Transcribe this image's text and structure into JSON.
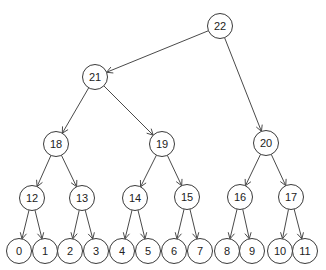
{
  "diagram": {
    "type": "tree",
    "node_radius": 12.5,
    "colors": {
      "stroke": "#3a3a3a",
      "edge": "#4a4a4a",
      "fill": "#ffffff",
      "text": "#222222"
    },
    "nodes": [
      {
        "id": "22",
        "label": "22",
        "x": 220,
        "y": 26
      },
      {
        "id": "21",
        "label": "21",
        "x": 95,
        "y": 77
      },
      {
        "id": "18",
        "label": "18",
        "x": 56,
        "y": 144
      },
      {
        "id": "19",
        "label": "19",
        "x": 162,
        "y": 144
      },
      {
        "id": "20",
        "label": "20",
        "x": 266,
        "y": 143
      },
      {
        "id": "12",
        "label": "12",
        "x": 32,
        "y": 198
      },
      {
        "id": "13",
        "label": "13",
        "x": 82,
        "y": 198
      },
      {
        "id": "14",
        "label": "14",
        "x": 135,
        "y": 198
      },
      {
        "id": "15",
        "label": "15",
        "x": 187,
        "y": 197
      },
      {
        "id": "16",
        "label": "16",
        "x": 240,
        "y": 197
      },
      {
        "id": "17",
        "label": "17",
        "x": 291,
        "y": 197
      },
      {
        "id": "0",
        "label": "0",
        "x": 19,
        "y": 251
      },
      {
        "id": "1",
        "label": "1",
        "x": 45,
        "y": 251
      },
      {
        "id": "2",
        "label": "2",
        "x": 70,
        "y": 251
      },
      {
        "id": "3",
        "label": "3",
        "x": 96,
        "y": 251
      },
      {
        "id": "4",
        "label": "4",
        "x": 122,
        "y": 251
      },
      {
        "id": "5",
        "label": "5",
        "x": 148,
        "y": 251
      },
      {
        "id": "6",
        "label": "6",
        "x": 174,
        "y": 251
      },
      {
        "id": "7",
        "label": "7",
        "x": 200,
        "y": 251
      },
      {
        "id": "8",
        "label": "8",
        "x": 227,
        "y": 251
      },
      {
        "id": "9",
        "label": "9",
        "x": 252,
        "y": 251
      },
      {
        "id": "10",
        "label": "10",
        "x": 280,
        "y": 251
      },
      {
        "id": "11",
        "label": "11",
        "x": 305,
        "y": 251
      }
    ],
    "edges": [
      {
        "from": "22",
        "to": "21"
      },
      {
        "from": "22",
        "to": "20"
      },
      {
        "from": "21",
        "to": "18"
      },
      {
        "from": "21",
        "to": "19"
      },
      {
        "from": "18",
        "to": "12"
      },
      {
        "from": "18",
        "to": "13"
      },
      {
        "from": "19",
        "to": "14"
      },
      {
        "from": "19",
        "to": "15"
      },
      {
        "from": "20",
        "to": "16"
      },
      {
        "from": "20",
        "to": "17"
      },
      {
        "from": "12",
        "to": "0"
      },
      {
        "from": "12",
        "to": "1"
      },
      {
        "from": "13",
        "to": "2"
      },
      {
        "from": "13",
        "to": "3"
      },
      {
        "from": "14",
        "to": "4"
      },
      {
        "from": "14",
        "to": "5"
      },
      {
        "from": "15",
        "to": "6"
      },
      {
        "from": "15",
        "to": "7"
      },
      {
        "from": "16",
        "to": "8"
      },
      {
        "from": "16",
        "to": "9"
      },
      {
        "from": "17",
        "to": "10"
      },
      {
        "from": "17",
        "to": "11"
      }
    ]
  }
}
